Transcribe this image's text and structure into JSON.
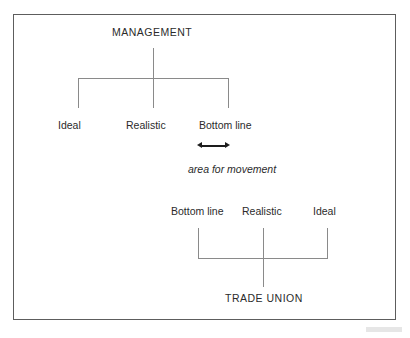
{
  "figure": {
    "border_color": "#5d5d5d",
    "line_color": "#8a8a8a",
    "text_color": "#2b2b2b",
    "arrow_color": "#1d1d1d"
  },
  "management": {
    "heading": "MANAGEMENT",
    "positions": [
      {
        "label": "Ideal"
      },
      {
        "label": "Realistic"
      },
      {
        "label": "Bottom line"
      }
    ]
  },
  "trade_union": {
    "heading": "TRADE UNION",
    "positions": [
      {
        "label": "Bottom line"
      },
      {
        "label": "Realistic"
      },
      {
        "label": "Ideal"
      }
    ]
  },
  "movement": {
    "caption": "area for movement",
    "arrow": "double-headed-horizontal-arrow"
  }
}
